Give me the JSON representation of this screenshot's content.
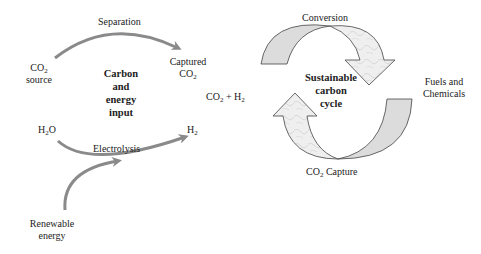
{
  "left_panel": {
    "title_lines": [
      "Carbon",
      "and",
      "energy",
      "input"
    ],
    "co2_source": {
      "line1_main": "CO",
      "line1_sub": "2",
      "line2": "source"
    },
    "separation": "Separation",
    "captured_co2": {
      "line1": "Captured",
      "line2_main": "CO",
      "line2_sub": "2"
    },
    "h2o": {
      "a": "H",
      "sub": "2",
      "b": "O"
    },
    "electrolysis": "Electrolysis",
    "h2": {
      "main": "H",
      "sub": "2"
    },
    "renewable_energy": {
      "line1": "Renewable",
      "line2": "energy"
    }
  },
  "middle": {
    "co2_h2": {
      "a": "CO",
      "a_sub": "2",
      "plus": " + H",
      "b_sub": "2"
    }
  },
  "right_panel": {
    "title_lines": [
      "Sustainable",
      "carbon",
      "cycle"
    ],
    "conversion": "Conversion",
    "fuels": {
      "line1": "Fuels and",
      "line2": "Chemicals"
    },
    "co2_capture": {
      "main": "CO",
      "sub": "2",
      "rest": " Capture"
    }
  },
  "colors": {
    "arrow_gray": "#8a8a8a",
    "band_fill": "#dcdcdc",
    "band_stroke": "#444444",
    "marble_fill": "#ececec"
  }
}
